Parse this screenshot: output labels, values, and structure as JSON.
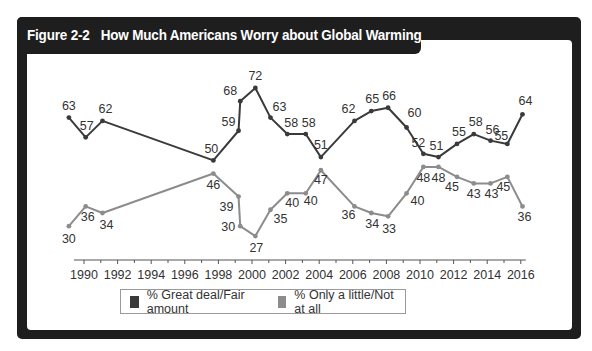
{
  "header": {
    "figure_label": "Figure 2-2",
    "title": "How Much Americans Worry about Global Warming"
  },
  "chart_data": {
    "type": "line",
    "title": "How Much Americans Worry about Global Warming",
    "xlabel": "",
    "ylabel": "",
    "xlim": [
      1988.9,
      2016.5
    ],
    "ylim": [
      20,
      80
    ],
    "grid": false,
    "x_ticks": [
      "1990",
      "1992",
      "1994",
      "1996",
      "1998",
      "2000",
      "2002",
      "2004",
      "2006",
      "2008",
      "2010",
      "2012",
      "2014",
      "2016"
    ],
    "legend_position": "bottom",
    "series": [
      {
        "name": "% Great deal/Fair amount",
        "color": "#3a3a3a",
        "x": [
          1989.1,
          1990.1,
          1991.1,
          1997.7,
          1999.2,
          1999.3,
          2000.2,
          2001.1,
          2002.1,
          2003.2,
          2004.1,
          2006.1,
          2007.1,
          2008.1,
          2009.2,
          2010.2,
          2011.1,
          2012.2,
          2013.2,
          2014.2,
          2015.2,
          2016.1
        ],
        "values": [
          63,
          57,
          62,
          50,
          59,
          68,
          72,
          63,
          58,
          58,
          51,
          62,
          65,
          66,
          60,
          52,
          51,
          55,
          58,
          56,
          55,
          64
        ],
        "label_offsets": [
          "above",
          "above-right",
          "above-right",
          "above-left",
          "left",
          "left",
          "above",
          "above-right",
          "above",
          "above",
          "above",
          "above-left",
          "above",
          "above",
          "above-right",
          "above-left",
          "above",
          "above",
          "above",
          "above",
          "above-left",
          "above"
        ]
      },
      {
        "name": "% Only a little/Not at all",
        "color": "#8c8c8c",
        "x": [
          1989.1,
          1990.1,
          1991.1,
          1997.7,
          1999.2,
          1999.3,
          2000.2,
          2001.1,
          2002.1,
          2003.2,
          2004.1,
          2006.1,
          2007.1,
          2008.1,
          2009.2,
          2010.2,
          2011.1,
          2012.2,
          2013.2,
          2014.2,
          2015.2,
          2016.1
        ],
        "values": [
          30,
          36,
          34,
          46,
          39,
          30,
          27,
          35,
          40,
          40,
          47,
          36,
          34,
          33,
          40,
          48,
          48,
          45,
          43,
          43,
          45,
          36
        ]
      }
    ]
  },
  "legend": {
    "items": [
      {
        "label": "% Great deal/Fair amount",
        "color": "#3a3a3a"
      },
      {
        "label": "% Only a little/Not at all",
        "color": "#8c8c8c"
      }
    ]
  }
}
